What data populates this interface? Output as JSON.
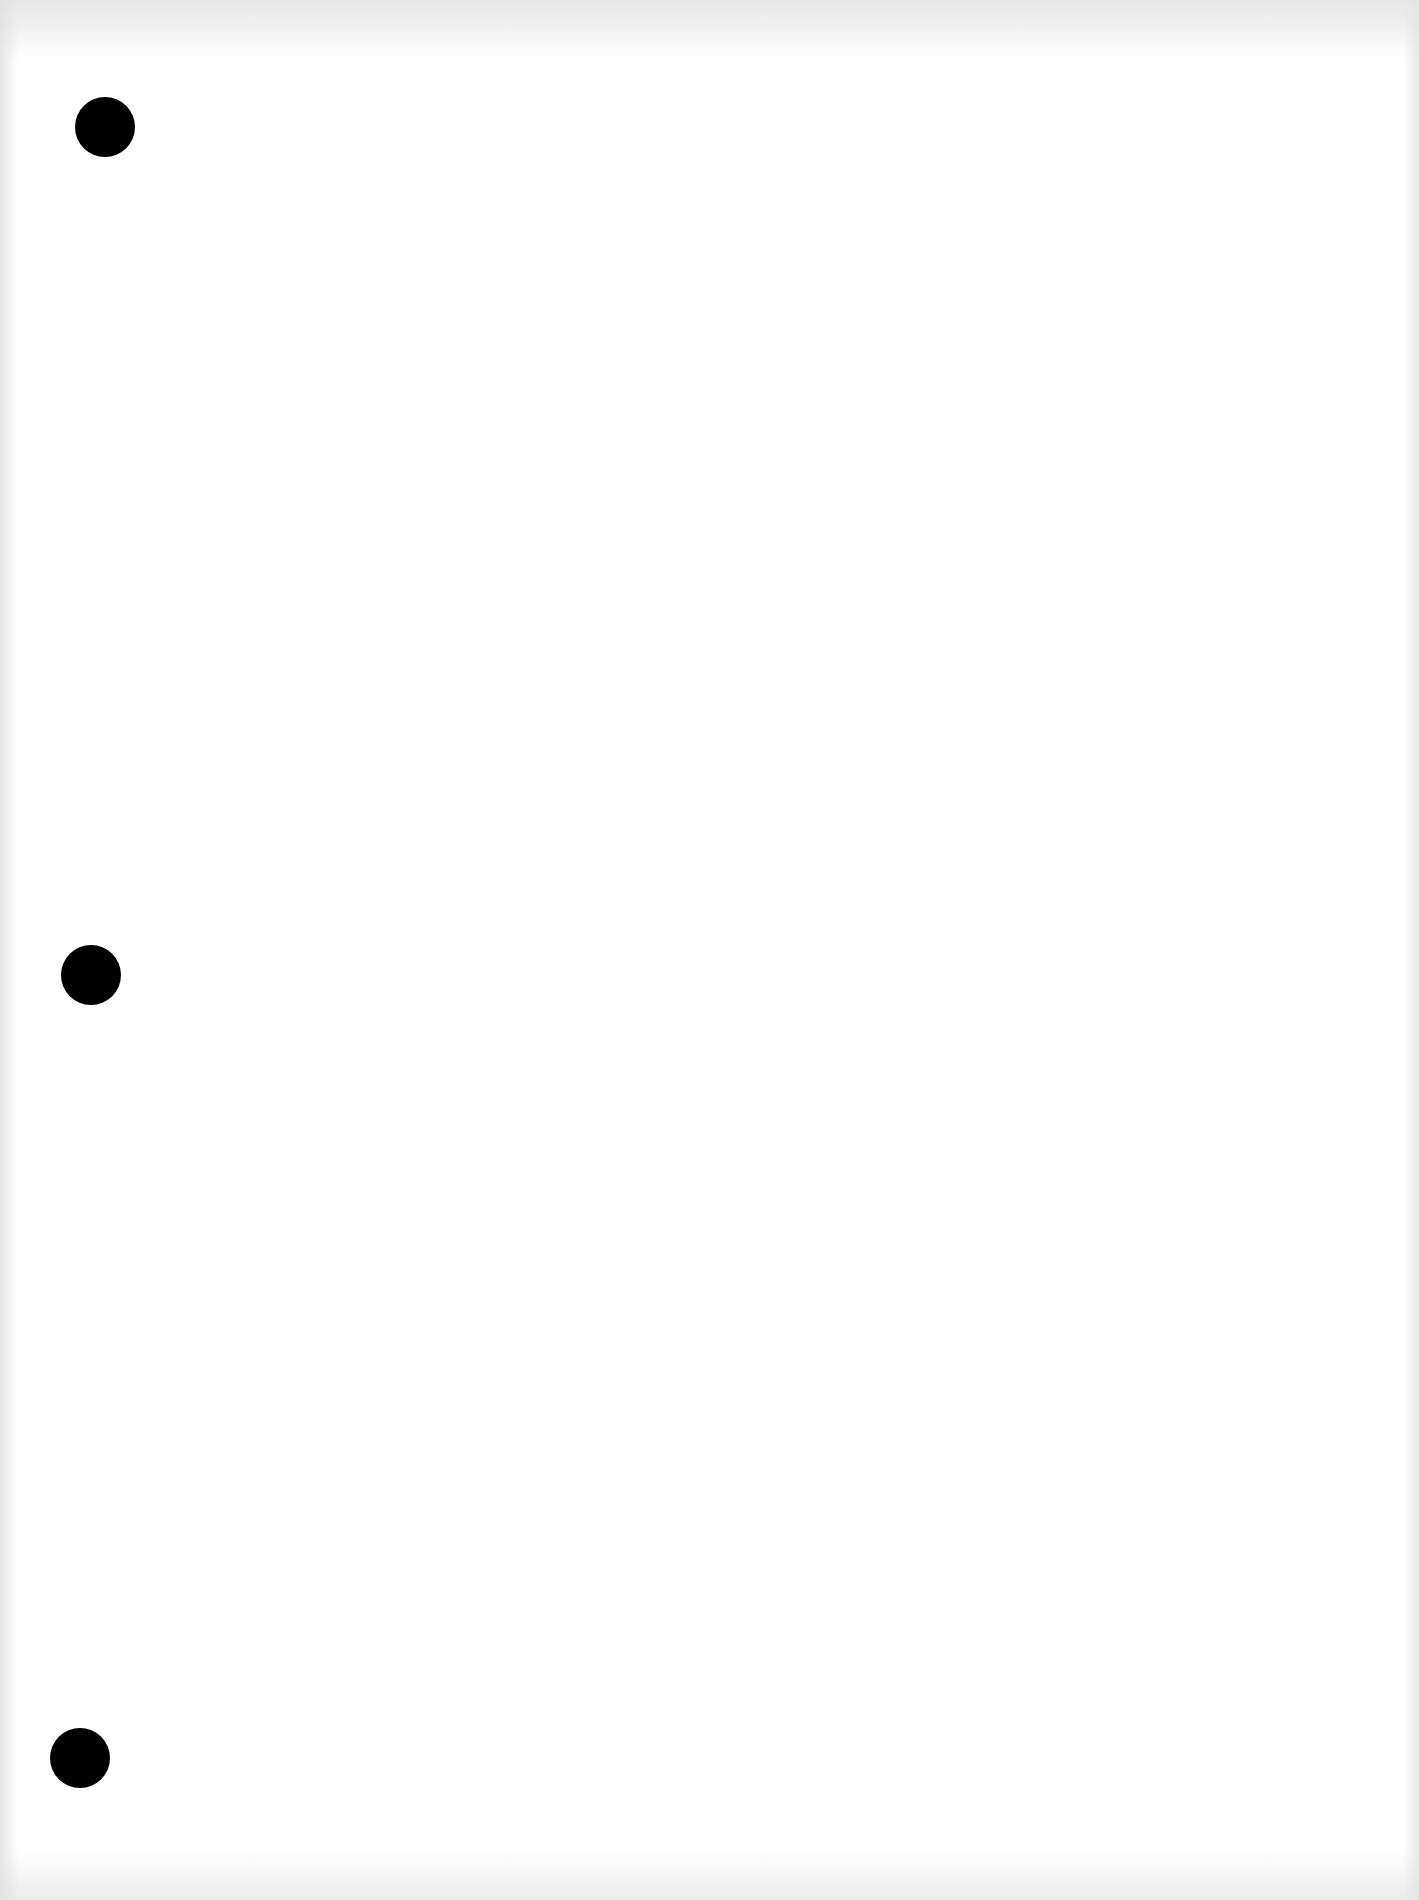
{
  "document": {
    "type": "blank-three-hole-punched-sheet",
    "text_content": "",
    "background_color": "#ffffff",
    "punch_holes": [
      {
        "position": "top",
        "color": "#000000"
      },
      {
        "position": "middle",
        "color": "#000000"
      },
      {
        "position": "bottom",
        "color": "#000000"
      }
    ]
  }
}
